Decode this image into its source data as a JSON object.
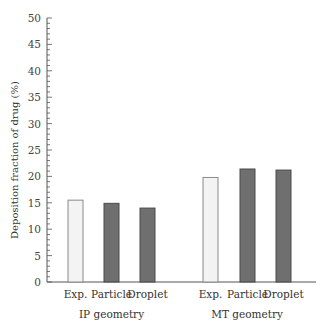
{
  "chart_data": {
    "type": "bar",
    "title": "",
    "xlabel": "",
    "ylabel": "Deposition fraction of drug (%)",
    "ylim": [
      0,
      50
    ],
    "yticks": [
      0,
      5,
      10,
      15,
      20,
      25,
      30,
      35,
      40,
      45,
      50
    ],
    "grid": false,
    "legend": null,
    "groups": [
      {
        "name": "IP geometry",
        "categories": [
          "Exp.",
          "Particle",
          "Droplet"
        ],
        "values": [
          15.5,
          14.9,
          14.0
        ]
      },
      {
        "name": "MT geometry",
        "categories": [
          "Exp.",
          "Particle",
          "Droplet"
        ],
        "values": [
          19.8,
          21.4,
          21.2
        ]
      }
    ],
    "colors": {
      "exp_fill": "#f3f3f3",
      "exp_stroke": "#8a8a8a",
      "sim_fill": "#6f6f6f",
      "sim_stroke": "#4a4a4a",
      "axis": "#555555"
    }
  }
}
